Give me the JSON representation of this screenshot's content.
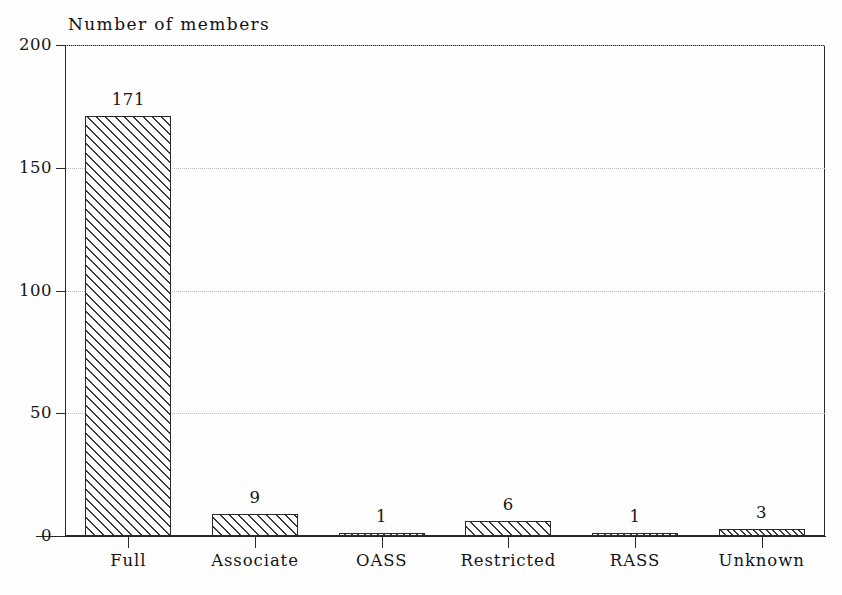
{
  "chart_data": {
    "type": "bar",
    "title": "Number of members",
    "xlabel": "",
    "ylabel": "",
    "categories": [
      "Full",
      "Associate",
      "OASS",
      "Restricted",
      "RASS",
      "Unknown"
    ],
    "values": [
      171,
      9,
      1,
      6,
      1,
      3
    ],
    "value_labels": [
      "171",
      "9",
      "1",
      "6",
      "1",
      "3"
    ],
    "ylim": [
      0,
      200
    ],
    "yticks": [
      0,
      50,
      100,
      150,
      200
    ],
    "ytick_labels": [
      "0",
      "50",
      "100",
      "150",
      "200"
    ],
    "grid": "horizontal-dotted",
    "legend": "none",
    "bar_fill": "diagonal-hatch",
    "colors": {
      "axis": "#2b2b2b",
      "bar_edge": "#2a2a2a",
      "hatch": "#3a3a3a",
      "grid": "#b9b9b9",
      "background": "#fefefe",
      "text": "#141414"
    }
  }
}
